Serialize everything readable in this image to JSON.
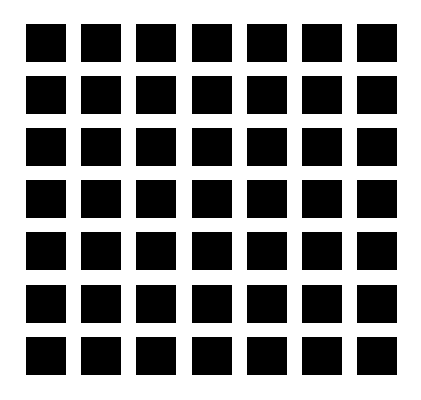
{
  "figure": {
    "rows": 7,
    "cols": 7,
    "square_color": "#000000",
    "background_color": "#ffffff",
    "col_x": [
      26,
      81,
      136,
      192,
      247,
      302,
      357
    ],
    "row_y": [
      24,
      76,
      128,
      180,
      232,
      285,
      337
    ],
    "square_w": 40,
    "square_h": 38
  }
}
